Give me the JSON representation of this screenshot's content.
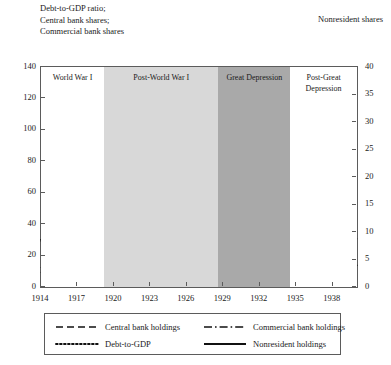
{
  "header": {
    "left_caption": "Debt-to-GDP ratio;\nCentral bank shares;\nCommercial bank shares",
    "right_caption": "Nonresident shares"
  },
  "chart_data": {
    "type": "line",
    "title": "",
    "xlabel": "",
    "ylabel_left": "Debt-to-GDP ratio; Central bank shares; Commercial bank shares",
    "ylabel_right": "Nonresident shares",
    "grid": false,
    "legend_position": "bottom",
    "xlim": [
      1914,
      1940
    ],
    "ylim_left": [
      0,
      140
    ],
    "ylim_right": [
      0,
      40
    ],
    "xticks": [
      1914,
      1917,
      1920,
      1923,
      1926,
      1929,
      1932,
      1935,
      1938
    ],
    "yticks_left": [
      0,
      20,
      40,
      60,
      80,
      100,
      120,
      140
    ],
    "yticks_right": [
      0,
      5,
      10,
      15,
      20,
      25,
      30,
      35,
      40
    ],
    "x": [
      1914,
      1915,
      1916,
      1917,
      1918,
      1919,
      1920,
      1921,
      1922,
      1923,
      1924,
      1925,
      1926,
      1927,
      1928,
      1929,
      1930,
      1931,
      1932,
      1933,
      1934,
      1935,
      1936,
      1937,
      1938,
      1939,
      1940
    ],
    "series": [
      {
        "name": "Debt-to-GDP",
        "axis": "left",
        "style": "dotted",
        "color": "#111111",
        "values": [
          30,
          32,
          38,
          45,
          52,
          60,
          69,
          78,
          81,
          71,
          73,
          77,
          79,
          74,
          68,
          62,
          58,
          59,
          65,
          72,
          78,
          84,
          86,
          82,
          75,
          69,
          68
        ]
      },
      {
        "name": "Central bank holdings",
        "axis": "left",
        "style": "dashed",
        "color": "#111111",
        "values": [
          12,
          18,
          17,
          18,
          19,
          20,
          21,
          21,
          20,
          20,
          22,
          21,
          16,
          15,
          14,
          17,
          18,
          18,
          17,
          16,
          17,
          20,
          22,
          23,
          23,
          24,
          29
        ]
      },
      {
        "name": "Commercial bank holdings",
        "axis": "left",
        "style": "dashdot",
        "color": "#111111",
        "values": [
          9,
          15,
          28,
          42,
          58,
          51,
          36,
          25,
          20,
          22,
          22,
          21,
          21,
          23,
          25,
          27,
          28,
          29,
          30,
          31,
          33,
          32,
          31,
          30,
          29,
          26,
          31
        ]
      },
      {
        "name": "Nonresident holdings",
        "axis": "right",
        "style": "solid",
        "color": "#111111",
        "values": [
          8.4,
          7.2,
          7.2,
          7.4,
          10.0,
          11.0,
          11.2,
          13.2,
          12.2,
          11.8,
          11.8,
          11.6,
          16.3,
          13.2,
          12.8,
          13.2,
          14.8,
          13.6,
          12.4,
          11.5,
          11.0,
          10.4,
          9.7,
          9.0,
          8.5,
          7.2,
          3.8
        ]
      }
    ],
    "bands": [
      {
        "label": "World War I",
        "start": 1914,
        "end": 1919.2,
        "color": "#ffffff"
      },
      {
        "label": "Post-World War I",
        "start": 1919.2,
        "end": 1928.6,
        "color": "#d8d8d8"
      },
      {
        "label": "Great Depression",
        "start": 1928.6,
        "end": 1934.5,
        "color": "#a9a9a9"
      },
      {
        "label": "Post-Great\nDepression",
        "start": 1934.5,
        "end": 1940,
        "color": "#ffffff"
      }
    ],
    "legend": [
      {
        "label": "Central bank holdings",
        "style": "dashed"
      },
      {
        "label": "Commercial bank holdings",
        "style": "dashdot"
      },
      {
        "label": "Debt-to-GDP",
        "style": "dotted"
      },
      {
        "label": "Nonresident holdings",
        "style": "solid"
      }
    ]
  }
}
